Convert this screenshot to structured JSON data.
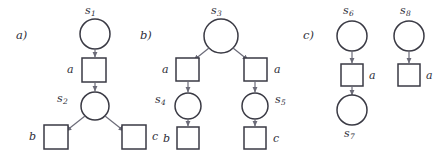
{
  "figure": {
    "type": "petri-net-fragments",
    "width": 442,
    "height": 154,
    "background": "#ffffff",
    "stroke_color": "#3a3a44",
    "edge_color": "#6b6b78",
    "text_color": "#2e2e38"
  },
  "panels": [
    {
      "id": "a",
      "label": "a)",
      "places": [
        {
          "name": "s1",
          "base": "s",
          "sub": "1",
          "cx": 95,
          "cy": 34,
          "r": 15
        },
        {
          "name": "s2",
          "base": "s",
          "sub": "2",
          "cx": 95,
          "cy": 106,
          "r": 14
        }
      ],
      "transitions": [
        {
          "name": "t-a",
          "label": "a",
          "x": 82,
          "y": 58,
          "w": 24,
          "h": 24
        },
        {
          "name": "t-b",
          "label": "b",
          "x": 44,
          "y": 125,
          "w": 24,
          "h": 24
        },
        {
          "name": "t-c",
          "label": "c",
          "x": 122,
          "y": 125,
          "w": 24,
          "h": 24
        }
      ]
    },
    {
      "id": "b",
      "label": "b)",
      "places": [
        {
          "name": "s3",
          "base": "s",
          "sub": "3",
          "cx": 221,
          "cy": 36,
          "r": 17
        },
        {
          "name": "s4",
          "base": "s",
          "sub": "4",
          "cx": 188,
          "cy": 106,
          "r": 13
        },
        {
          "name": "s5",
          "base": "s",
          "sub": "5",
          "cx": 255,
          "cy": 106,
          "r": 13
        }
      ],
      "transitions": [
        {
          "name": "t-a-left",
          "label": "a",
          "x": 176,
          "y": 58,
          "w": 23,
          "h": 23
        },
        {
          "name": "t-a-right",
          "label": "a",
          "x": 244,
          "y": 58,
          "w": 23,
          "h": 23
        },
        {
          "name": "t-b",
          "label": "b",
          "x": 177,
          "y": 127,
          "w": 22,
          "h": 22
        },
        {
          "name": "t-c",
          "label": "c",
          "x": 244,
          "y": 127,
          "w": 22,
          "h": 22
        }
      ]
    },
    {
      "id": "c",
      "label": "c)",
      "places": [
        {
          "name": "s6",
          "base": "s",
          "sub": "6",
          "cx": 352,
          "cy": 36,
          "r": 15
        },
        {
          "name": "s7",
          "base": "s",
          "sub": "7",
          "cx": 352,
          "cy": 110,
          "r": 15
        },
        {
          "name": "s8",
          "base": "s",
          "sub": "8",
          "cx": 409,
          "cy": 36,
          "r": 15
        }
      ],
      "transitions": [
        {
          "name": "t-a-left",
          "label": "a",
          "x": 341,
          "y": 64,
          "w": 22,
          "h": 22
        },
        {
          "name": "t-a-right",
          "label": "a",
          "x": 398,
          "y": 64,
          "w": 22,
          "h": 22
        }
      ]
    }
  ],
  "panel_labels": {
    "a": "a)",
    "b": "b)",
    "c": "c)"
  },
  "state_labels": {
    "s1": {
      "base": "s",
      "sub": "1"
    },
    "s2": {
      "base": "s",
      "sub": "2"
    },
    "s3": {
      "base": "s",
      "sub": "3"
    },
    "s4": {
      "base": "s",
      "sub": "4"
    },
    "s5": {
      "base": "s",
      "sub": "5"
    },
    "s6": {
      "base": "s",
      "sub": "6"
    },
    "s7": {
      "base": "s",
      "sub": "7"
    },
    "s8": {
      "base": "s",
      "sub": "8"
    }
  },
  "action_labels": {
    "a_a1": "a",
    "a_b": "b",
    "a_c": "c",
    "b_a_left": "a",
    "b_a_right": "a",
    "b_b": "b",
    "b_c": "c",
    "c_a_left": "a",
    "c_a_right": "a"
  }
}
